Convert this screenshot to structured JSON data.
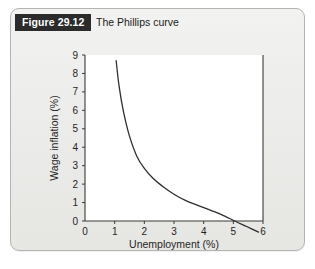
{
  "figure": {
    "number_label": "Figure 29.12",
    "caption_title": "The Phillips curve"
  },
  "colors": {
    "badge_background": "#2b2b2b",
    "badge_text": "#ffffff",
    "card_background": "#eeeeec",
    "card_border": "#b4b4b4",
    "plot_background": "#ffffff",
    "axis": "#3a3a3a",
    "curve": "#2e2e2e"
  },
  "chart_data": {
    "type": "line",
    "title": "The Phillips curve",
    "xlabel": "Unemployment (%)",
    "ylabel": "Wage inflation (%)",
    "xlim": [
      0,
      6
    ],
    "ylim": [
      0,
      9
    ],
    "xticks": [
      0,
      1,
      2,
      3,
      4,
      5,
      6
    ],
    "xtick_labels": [
      "0",
      "1",
      "2",
      "3",
      "4",
      "5",
      "6"
    ],
    "yticks": [
      0,
      1,
      2,
      3,
      4,
      5,
      6,
      7,
      8,
      9
    ],
    "ytick_labels": [
      "0",
      "1",
      "2",
      "3",
      "4",
      "5",
      "6",
      "7",
      "8",
      "9"
    ],
    "grid": false,
    "legend": false,
    "series": [
      {
        "name": "Phillips curve",
        "x": [
          1.05,
          1.15,
          1.3,
          1.5,
          1.75,
          2.0,
          2.3,
          2.6,
          3.0,
          3.4,
          3.8,
          4.2,
          4.6,
          5.05,
          5.45,
          5.85
        ],
        "y": [
          8.7,
          7.3,
          5.9,
          4.6,
          3.5,
          2.85,
          2.3,
          1.9,
          1.45,
          1.1,
          0.85,
          0.6,
          0.35,
          0.0,
          -0.3,
          -0.6
        ]
      }
    ]
  }
}
